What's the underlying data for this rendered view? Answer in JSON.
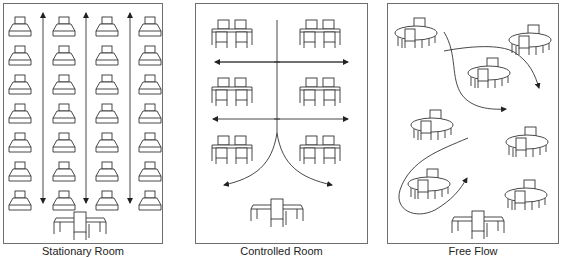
{
  "panels": [
    {
      "id": "stationary",
      "label": "Stationary Room",
      "frame": {
        "x": 3,
        "y": 3,
        "w": 160,
        "h": 241
      },
      "desks": {
        "columns_x": [
          20,
          64,
          107,
          150
        ],
        "rows_y": [
          17,
          46,
          75,
          104,
          133,
          162,
          191
        ]
      },
      "aisle_arrows_x": [
        43,
        86,
        130
      ],
      "aisle_arrow_y": [
        13,
        203
      ],
      "teacher_desk": {
        "x": 80,
        "y": 212
      }
    },
    {
      "id": "controlled",
      "label": "Controlled Room",
      "frame": {
        "x": 195,
        "y": 3,
        "w": 173,
        "h": 241
      },
      "table_groups": [
        {
          "x": 232,
          "y": 20
        },
        {
          "x": 320,
          "y": 20
        },
        {
          "x": 232,
          "y": 78
        },
        {
          "x": 320,
          "y": 78
        },
        {
          "x": 232,
          "y": 136
        },
        {
          "x": 320,
          "y": 136
        }
      ],
      "horizontal_arrows_y": [
        62,
        119
      ],
      "horizontal_arrows_x": [
        213,
        348
      ],
      "center_line_x": 277,
      "teacher_desk": {
        "x": 277,
        "y": 199
      }
    },
    {
      "id": "free-flow",
      "label": "Free Flow",
      "frame": {
        "x": 387,
        "y": 3,
        "w": 172,
        "h": 241
      },
      "round_tables": [
        {
          "x": 416,
          "y": 18
        },
        {
          "x": 530,
          "y": 25
        },
        {
          "x": 489,
          "y": 58
        },
        {
          "x": 432,
          "y": 110
        },
        {
          "x": 527,
          "y": 127
        },
        {
          "x": 429,
          "y": 169
        },
        {
          "x": 526,
          "y": 180
        }
      ],
      "teacher_desk": {
        "x": 478,
        "y": 211
      }
    }
  ]
}
